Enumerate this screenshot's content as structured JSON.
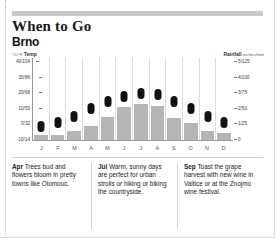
{
  "header": {
    "title": "When to Go",
    "subtitle": "Brno"
  },
  "axes": {
    "left_caption_unit": "°C/°F",
    "left_caption_label": "Temp",
    "right_caption_label": "Rainfall",
    "right_caption_unit": "inches/mm"
  },
  "chart_data": {
    "type": "bar",
    "title": "Brno",
    "categories": [
      "J",
      "F",
      "M",
      "A",
      "M",
      "J",
      "J",
      "A",
      "S",
      "O",
      "N",
      "D"
    ],
    "series": [
      {
        "name": "Rainfall",
        "type": "bar",
        "unit": "inches/mm",
        "values": [
          0.3,
          0.35,
          0.6,
          0.9,
          1.5,
          2.1,
          2.3,
          2.2,
          1.4,
          1.1,
          0.6,
          0.45
        ],
        "axis": "right",
        "color": "#b5b5b5"
      },
      {
        "name": "Temp",
        "type": "marker",
        "unit": "°C/°F",
        "values": [
          -2,
          0,
          4,
          9,
          14,
          17,
          19,
          18,
          14,
          9,
          4,
          0
        ],
        "axis": "left",
        "color": "#111111"
      }
    ],
    "left_ticks": [
      "40/104",
      "30/86",
      "20/68",
      "10/50",
      "0/32",
      "-10/14"
    ],
    "left_tick_values": [
      40,
      30,
      20,
      10,
      0,
      -10
    ],
    "right_ticks": [
      "5/125",
      "4/100",
      "3/75",
      "2/50",
      "1/25",
      "0"
    ],
    "right_tick_values": [
      5,
      4,
      3,
      2,
      1,
      0
    ],
    "ylim_left": [
      -10,
      40
    ],
    "ylim_right": [
      0,
      5
    ],
    "xlabel": "",
    "ylabel": "Temp",
    "grid": false,
    "legend": "none"
  },
  "notes": [
    {
      "month": "Apr",
      "text": " Trees bud and flowers bloom in pretty towns like Olomouc."
    },
    {
      "month": "Jul",
      "text": " Warm, sunny days are perfect for urban strolls or hiking or biking the countryside."
    },
    {
      "month": "Sep",
      "text": " Toast the grape harvest with new wine in Valtice or at the Znojmo wine festival."
    }
  ]
}
